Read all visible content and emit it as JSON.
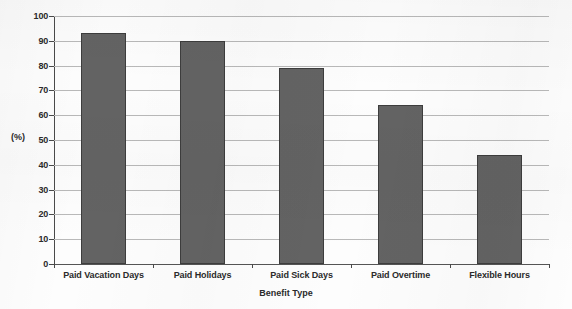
{
  "chart_data": {
    "type": "bar",
    "title": "",
    "categories": [
      "Paid Vacation Days",
      "Paid Holidays",
      "Paid Sick Days",
      "Paid Overtime",
      "Flexible Hours"
    ],
    "values": [
      93,
      90,
      79,
      64,
      44
    ],
    "xlabel": "Benefit Type",
    "ylabel": "(%)",
    "ylim": [
      0,
      100
    ],
    "ytick_labels": [
      "0",
      "10",
      "20",
      "30",
      "40",
      "50",
      "60",
      "70",
      "80",
      "90",
      "100"
    ],
    "ytick_values": [
      0,
      10,
      20,
      30,
      40,
      50,
      60,
      70,
      80,
      90,
      100
    ],
    "grid": true,
    "legend": "none",
    "bar_color": "#636363",
    "bar_border_color": "#3d3d3d",
    "gridline_color": "#b9b9b9",
    "axis_color": "#4a4a4a",
    "background_color": "#fdfdfd"
  }
}
